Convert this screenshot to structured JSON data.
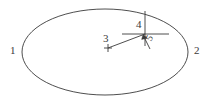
{
  "figure": {
    "type": "line-diagram",
    "background_color": "#ffffff",
    "stroke_color": "#3a3a3a",
    "text_color": "#3a3a3a",
    "canvas": {
      "width": 212,
      "height": 104
    },
    "ellipse": {
      "name": "outer-ellipse",
      "cx": 105,
      "cy": 52,
      "rx": 83,
      "ry": 43,
      "stroke_width": 0.9
    },
    "crosshair": {
      "name": "crosshair-marker",
      "center_x": 145,
      "center_y": 34,
      "vertical_line": {
        "x": 145,
        "y1": 11,
        "y2": 46
      },
      "horizontal_line": {
        "y": 34,
        "x1": 122,
        "x2": 169
      }
    },
    "plus_marker": {
      "name": "plus-marker",
      "center_x": 108,
      "center_y": 48,
      "arm": 4
    },
    "leader_line": {
      "name": "leader-line",
      "x1": 108,
      "y1": 48,
      "x2": 145,
      "y2": 34
    },
    "arrow": {
      "name": "angle-arrow",
      "tail_x": 150,
      "tail_y": 49,
      "tip_x": 143,
      "tip_y": 36
    },
    "labels": [
      {
        "id": "1",
        "text": "1",
        "role": "left-ellipse-callout"
      },
      {
        "id": "2",
        "text": "2",
        "role": "right-ellipse-callout"
      },
      {
        "id": "3",
        "text": "3",
        "role": "plus-marker-callout"
      },
      {
        "id": "4",
        "text": "4",
        "role": "crosshair-callout"
      },
      {
        "id": "5",
        "text": "5",
        "role": "arrow-callout"
      }
    ]
  }
}
